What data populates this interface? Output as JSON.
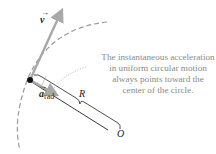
{
  "diagram": {
    "labels": {
      "velocity": "v",
      "acceleration": "a",
      "acceleration_sub": "rad",
      "radius": "R",
      "center": "O"
    },
    "caption_lines": [
      "The instantaneous acceleration",
      "in uniform circular motion",
      "always points toward the",
      "center of the circle."
    ],
    "colors": {
      "path": "#9a9a9a",
      "vector": "#a8a8a8",
      "point": "#111111",
      "text": "#8a8a8a",
      "line": "#222222"
    }
  }
}
